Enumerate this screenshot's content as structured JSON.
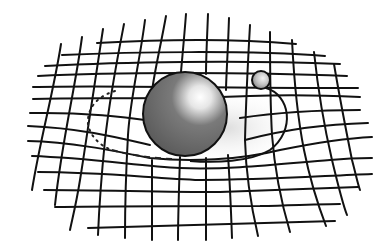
{
  "diagram": {
    "colors": {
      "background": "#ffffff",
      "grid": "#111111",
      "large_sphere_base": "#6b6b6b",
      "large_sphere_highlight": "#ffffff",
      "small_sphere_base": "#8a8a8a",
      "small_sphere_highlight": "#f2f2f2",
      "well_shadow": "#e2e2e2"
    },
    "large_sphere": {
      "cx": 185,
      "cy": 114,
      "r": 42
    },
    "small_sphere": {
      "cx": 261,
      "cy": 80,
      "r": 9
    },
    "horizontal_lines": [
      "M97,43 C150,40 230,38 296,44",
      "M62,55 C130,52 250,50 325,56",
      "M45,66 C120,62 240,60 340,64",
      "M38,76 C110,72 250,72 347,76",
      "M33,87 C100,85 200,88 358,88",
      "M33,99 C90,97 150,100 250,96 C300,94 340,96 360,97",
      "M30,113 C90,112 130,118 160,122 M240,118 C280,112 330,110 360,110",
      "M28,126 C80,128 120,138 150,145 M245,140 C290,128 330,124 368,123",
      "M28,141 C70,142 110,150 150,158 C190,162 240,160 280,150 C320,142 350,138 372,137",
      "M32,156 C90,158 140,166 180,168 C230,170 280,164 330,160 C350,158 362,158 372,158",
      "M38,172 C100,172 150,178 200,180 C260,180 320,176 372,174",
      "M44,190 C100,190 160,192 220,192 C280,190 330,188 358,187",
      "M55,207 C120,206 200,206 260,206 C300,205 325,204 340,204",
      "M88,228 C150,226 230,224 335,221"
    ],
    "vertical_lines": [
      "M61,44 C54,90 40,140 32,190",
      "M82,37 C75,90 62,140 55,205",
      "M103,29 C95,80 88,130 80,180 C76,205 72,220 70,230",
      "M124,24 C117,60 110,95 105,140 C101,180 99,210 98,235",
      "M145,20 C140,60 130,100 128,135 C126,170 125,210 125,238",
      "M166,16 C160,50 150,90 150,110 M152,160 C152,190 152,215 152,240",
      "M186,14 C184,40 182,60 181,72 M180,157 C179,190 178,215 178,240",
      "M208,14 C207,40 206,58 206,74 M206,158 C206,190 206,215 206,240",
      "M229,18 C228,50 226,80 226,90 M228,155 C230,185 231,210 232,238",
      "M250,25 C248,60 246,100 245,140 C246,180 252,210 258,236",
      "M270,32 C270,70 270,100 272,135 C275,175 282,205 290,232",
      "M292,40 C294,80 298,120 304,150 C310,180 318,205 326,226",
      "M314,52 C318,90 325,130 332,160 C338,185 343,205 347,215",
      "M334,64 C340,100 346,130 352,160 C356,175 358,185 360,190"
    ],
    "orbit": {
      "front_solid": "M266,88 C290,95 296,130 270,150 C250,162 215,163 190,161",
      "back_dotted": "M115,91 C95,97 87,110 88,124 C90,136 100,146 112,150",
      "front_dashed": "M112,150 C130,155 150,158 172,159",
      "shadow": "M228,120 C250,110 280,115 290,130 C290,150 260,160 230,160 Z"
    }
  }
}
